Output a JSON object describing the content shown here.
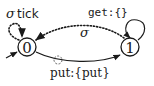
{
  "diagram": {
    "type": "state-machine",
    "states": [
      {
        "id": "0",
        "label": "0",
        "initial": true
      },
      {
        "id": "1",
        "label": "1",
        "initial": false
      }
    ],
    "transitions": [
      {
        "from": "0",
        "to": "0",
        "style": "dotted",
        "label_symbol": "σ",
        "label_text": "tick"
      },
      {
        "from": "1",
        "to": "1",
        "style": "solid",
        "label_text": "get:{}"
      },
      {
        "from": "1",
        "to": "0",
        "style": "dotted",
        "label_symbol": "σ"
      },
      {
        "from": "0",
        "to": "1",
        "style": "solid",
        "label_text": "put:{put}"
      }
    ],
    "colors": {
      "stroke": "#1a1a1a",
      "background": "#ffffff"
    }
  }
}
